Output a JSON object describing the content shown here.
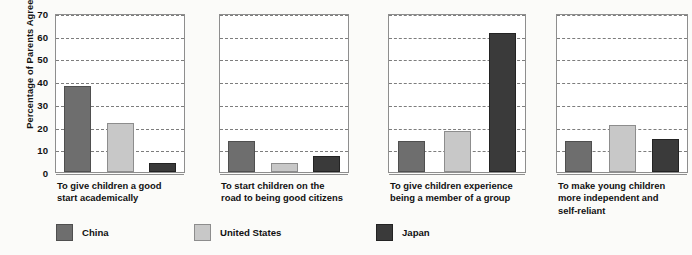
{
  "chart_data": {
    "type": "bar",
    "title": "",
    "subtitle": "",
    "xlabel": "",
    "ylabel": "Percentage of Parents Agreeing",
    "ylim": [
      0,
      70
    ],
    "ytick_values": [
      0,
      10,
      20,
      30,
      40,
      50,
      60,
      70
    ],
    "ytick_labels": [
      "0",
      "10",
      "20",
      "30",
      "40",
      "50",
      "60",
      "70"
    ],
    "grid": "horizontal-dashed",
    "legend_position": "bottom-left",
    "panel_layout": "four-side-by-side-panels-shared-y-axis",
    "categories": [
      "To give children a good start academically",
      "To start children on the road to being good citizens",
      "To give children experience being a member of a group",
      "To make young children more independent and self-reliant"
    ],
    "category_label_lines": [
      [
        "To give children a good",
        "start academically"
      ],
      [
        "To start children on the",
        "road to being good citizens"
      ],
      [
        "To give children experience",
        "being a member of a group"
      ],
      [
        "To make young children",
        "more independent and",
        "self-reliant"
      ]
    ],
    "series": [
      {
        "name": "China",
        "color": "#6e6e6e",
        "values": [
          38,
          13.5,
          13.5,
          13.5
        ]
      },
      {
        "name": "United States",
        "color": "#c8c8c8",
        "values": [
          21.5,
          4,
          18,
          20.5
        ]
      },
      {
        "name": "Japan",
        "color": "#3a3a3a",
        "values": [
          4,
          7,
          61,
          14.5
        ]
      }
    ]
  },
  "legend": {
    "items": [
      {
        "label": "China"
      },
      {
        "label": "United States"
      },
      {
        "label": "Japan"
      }
    ]
  }
}
